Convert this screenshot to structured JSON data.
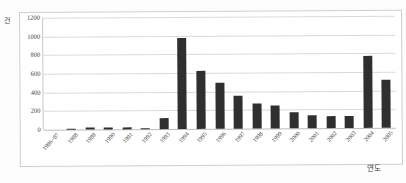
{
  "chart_data": {
    "type": "bar",
    "title": "",
    "subtitle": "",
    "xlabel": "연도",
    "ylabel": "건",
    "ylim": [
      0,
      1200
    ],
    "ytick_step": 200,
    "yticks": [
      "1200",
      "1000",
      "800",
      "600",
      "400",
      "200",
      "0"
    ],
    "ytick_values": [
      1200,
      1000,
      800,
      600,
      400,
      200,
      0
    ],
    "grid": true,
    "legend": false,
    "legend_position": "none",
    "bar_color": "#2f2f2f",
    "categories": [
      "1986~87",
      "1988",
      "1989",
      "1990",
      "1991",
      "1992",
      "1993",
      "1994",
      "1995",
      "1996",
      "1997",
      "1998",
      "1999",
      "2000",
      "2001",
      "2002",
      "2003",
      "2004",
      "2005"
    ],
    "values": [
      0,
      5,
      20,
      17,
      17,
      15,
      120,
      970,
      625,
      495,
      350,
      265,
      248,
      170,
      138,
      132,
      125,
      775,
      512
    ]
  }
}
